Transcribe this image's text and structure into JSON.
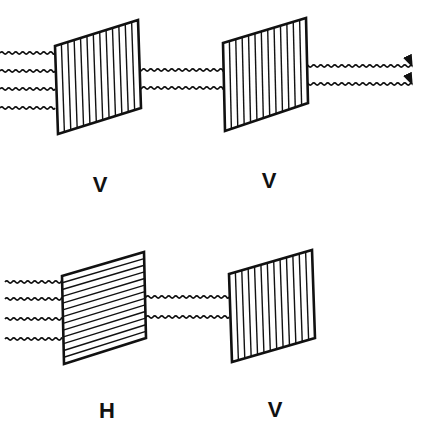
{
  "diagram": {
    "stroke_color": "#111111",
    "background": "#ffffff",
    "rows": [
      {
        "name": "parallel",
        "filters": [
          {
            "label": "V",
            "orientation": "vertical"
          },
          {
            "label": "V",
            "orientation": "vertical"
          }
        ],
        "waves_in": 4,
        "waves_between": 2,
        "waves_out": 2,
        "output_arrows": true
      },
      {
        "name": "crossed",
        "filters": [
          {
            "label": "H",
            "orientation": "horizontal"
          },
          {
            "label": "V",
            "orientation": "vertical"
          }
        ],
        "waves_in": 4,
        "waves_between": 2,
        "waves_out": 0,
        "output_arrows": false
      }
    ]
  }
}
